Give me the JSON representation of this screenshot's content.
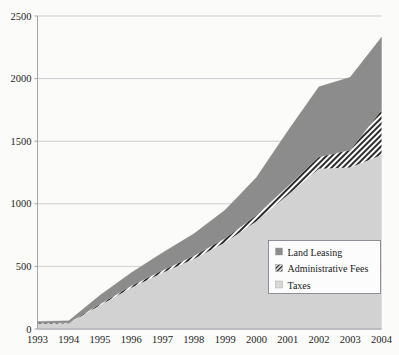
{
  "chart_data": {
    "type": "area",
    "title": "",
    "subtitle": "",
    "xlabel": "",
    "ylabel": "",
    "stacked": true,
    "grid": true,
    "legend_position": "inside-right",
    "categories": [
      "1993",
      "1994",
      "1995",
      "1996",
      "1997",
      "1998",
      "1999",
      "2000",
      "2001",
      "2002",
      "2003",
      "2004"
    ],
    "x": [
      1993,
      1994,
      1995,
      1996,
      1997,
      1998,
      1999,
      2000,
      2001,
      2002,
      2003,
      2004
    ],
    "xlim": [
      1993,
      2004
    ],
    "ylim": [
      0,
      2500
    ],
    "yticks": [
      0,
      500,
      1000,
      1500,
      2000,
      2500
    ],
    "xticks": [
      "1993",
      "1994",
      "1995",
      "1996",
      "1997",
      "1998",
      "1999",
      "2000",
      "2001",
      "2002",
      "2003",
      "2004"
    ],
    "series": [
      {
        "name": "Taxes",
        "color": "#d2d2d2",
        "pattern": "solid-light",
        "values": [
          40,
          45,
          190,
          330,
          450,
          560,
          690,
          860,
          1070,
          1280,
          1290,
          1390
        ]
      },
      {
        "name": "Administrative Fees",
        "color": "#ffffff",
        "pattern": "diagonal-hatch",
        "values": [
          5,
          5,
          10,
          15,
          20,
          25,
          35,
          50,
          70,
          95,
          140,
          360
        ]
      },
      {
        "name": "Land Leasing",
        "color": "#8c8c8c",
        "pattern": "solid-gray",
        "values": [
          15,
          15,
          70,
          105,
          140,
          175,
          225,
          300,
          440,
          560,
          580,
          580
        ]
      }
    ],
    "totals": [
      60,
      65,
      270,
      450,
      610,
      760,
      950,
      1210,
      1580,
      1935,
      2010,
      2330
    ]
  },
  "legend": {
    "entries": [
      {
        "label": "Land Leasing",
        "marker": "solid-gray-square"
      },
      {
        "label": "Administrative Fees",
        "marker": "hatched-square"
      },
      {
        "label": "Taxes",
        "marker": "light-gray-square"
      }
    ]
  },
  "axes": {
    "y_tick_labels": [
      "2500",
      "2000",
      "1500",
      "1000",
      "500",
      "0"
    ],
    "x_tick_labels": [
      "1993",
      "1994",
      "1995",
      "1996",
      "1997",
      "1998",
      "1999",
      "2000",
      "2001",
      "2002",
      "2003",
      "2004"
    ]
  },
  "colors": {
    "land_leasing": "#8c8c8c",
    "administrative_fees": "#ffffff",
    "taxes": "#d2d2d2",
    "gridline": "#b9b9c4",
    "axis": "#9a9aa6",
    "text": "#1e1e1e",
    "background": "#ffffff"
  }
}
